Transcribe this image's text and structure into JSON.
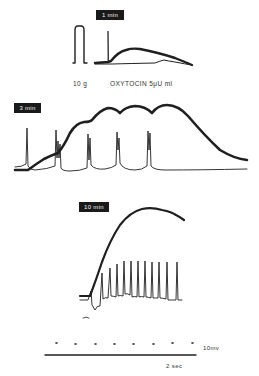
{
  "figure": {
    "panels": [
      {
        "id": "panel-1min",
        "time_label": "1 min",
        "calibration_label": "10 g",
        "stimulus_label": "OXYTOCIN 5μU ml"
      },
      {
        "id": "panel-3min",
        "time_label": "3 min"
      },
      {
        "id": "panel-10min",
        "time_label": "10 min"
      }
    ],
    "scale_bar": {
      "voltage_label": "10mv",
      "time_label": "2 sec"
    }
  },
  "colors": {
    "trace": "#1f1f1f",
    "background": "#ffffff",
    "tag_bg": "#1a1a1a",
    "tag_text": "#f4f4f4"
  }
}
